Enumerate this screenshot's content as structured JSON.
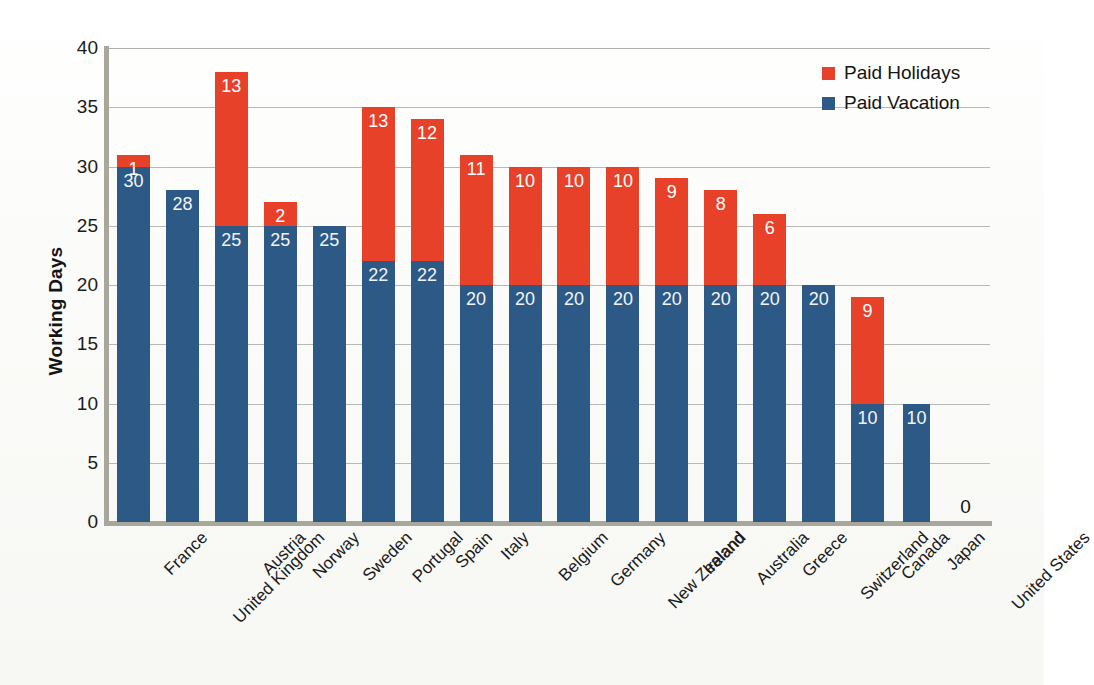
{
  "chart_data": {
    "type": "bar",
    "subtype": "stacked-bar",
    "title": "",
    "xlabel": "",
    "ylabel": "Working Days",
    "ylim": [
      0,
      40
    ],
    "ytick_step": 5,
    "yticks": [
      40,
      35,
      30,
      25,
      20,
      15,
      10,
      5,
      0
    ],
    "grid": "horizontal",
    "legend_position": "top-right",
    "categories": [
      "France",
      "United Kingdom",
      "Austria",
      "Norway",
      "Sweden",
      "Portugal",
      "Spain",
      "Italy",
      "Belgium",
      "Germany",
      "New Zealand",
      "Ireland",
      "Australia",
      "Greece",
      "Switzerland",
      "Canada",
      "Japan",
      "United States"
    ],
    "series": [
      {
        "name": "Paid Vacation",
        "color": "#2d5986",
        "values": [
          30,
          28,
          25,
          25,
          25,
          22,
          22,
          20,
          20,
          20,
          20,
          20,
          20,
          20,
          20,
          10,
          10,
          0
        ],
        "labels": [
          "30",
          "28",
          "25",
          "25",
          "25",
          "22",
          "22",
          "20",
          "20",
          "20",
          "20",
          "20",
          "20",
          "20",
          "20",
          "10",
          "10",
          ""
        ]
      },
      {
        "name": "Paid Holidays",
        "color": "#e8412a",
        "values": [
          1,
          0,
          13,
          2,
          0,
          13,
          12,
          11,
          10,
          10,
          10,
          9,
          8,
          6,
          0,
          9,
          0,
          0
        ],
        "labels": [
          "1",
          "",
          "13",
          "2",
          "",
          "13",
          "12",
          "11",
          "10",
          "10",
          "10",
          "9",
          "8",
          "6",
          "",
          "9",
          "",
          ""
        ]
      }
    ],
    "totals": [
      31,
      28,
      38,
      27,
      25,
      35,
      34,
      31,
      30,
      30,
      30,
      29,
      28,
      26,
      20,
      19,
      10,
      0
    ],
    "zero_labels": [
      {
        "category": "United States",
        "text": "0"
      }
    ]
  },
  "legend": {
    "items": [
      {
        "label": "Paid Holidays",
        "color": "#e8412a",
        "swatch": "legend-swatch-holiday"
      },
      {
        "label": "Paid Vacation",
        "color": "#2d5986",
        "swatch": "legend-swatch-vacation"
      }
    ]
  },
  "axis": {
    "y_title": "Working Days"
  }
}
